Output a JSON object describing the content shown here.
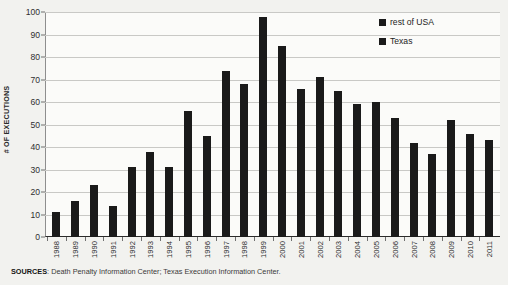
{
  "chart_data": {
    "type": "bar",
    "title": "",
    "xlabel": "",
    "ylabel": "# OF EXECUTIONS",
    "ylim": [
      0,
      100
    ],
    "ytick_step": 10,
    "yticks": [
      "100",
      "90",
      "80",
      "70",
      "60",
      "50",
      "40",
      "30",
      "20",
      "10",
      "0"
    ],
    "grid": true,
    "legend_position": "top-right",
    "bar_color": "#1a1a1a",
    "categories": [
      "1988",
      "1989",
      "1990",
      "1991",
      "1992",
      "1993",
      "1994",
      "1995",
      "1996",
      "1997",
      "1998",
      "1999",
      "2000",
      "2001",
      "2002",
      "2003",
      "2004",
      "2005",
      "2006",
      "2007",
      "2008",
      "2009",
      "2010",
      "2011"
    ],
    "values": [
      11,
      16,
      23,
      14,
      31,
      38,
      31,
      56,
      45,
      74,
      68,
      98,
      85,
      66,
      71,
      65,
      59,
      60,
      53,
      42,
      37,
      52,
      46,
      43
    ],
    "series": [
      {
        "name": "rest of USA",
        "color": "#1a1a1a"
      },
      {
        "name": "Texas",
        "color": "#1a1a1a"
      }
    ],
    "legend": [
      {
        "label": "rest of USA",
        "color": "#1a1a1a"
      },
      {
        "label": "Texas",
        "color": "#1a1a1a"
      }
    ]
  },
  "footer": {
    "sources_label": "SOURCES",
    "sources_text": ": Death Penalty Information Center; Texas Execution Information Center."
  }
}
